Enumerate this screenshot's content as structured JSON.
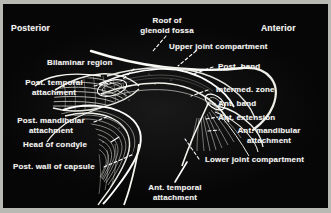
{
  "figure": {
    "kind": "anatomical-illustration",
    "plate_background": "#060606",
    "label_color": "#f2f2ef",
    "border_color": "#b9b9b4"
  },
  "orientation": {
    "posterior": "Posterior",
    "anterior": "Anterior"
  },
  "labels": {
    "roof_of_glenoid_fossa": "Roof of\nglenoid fossa",
    "upper_joint_compartment": "Upper joint compartment",
    "bilaminar_region": "Bilaminar region",
    "post_temporal_attachment": "Post. temporal\nattachment",
    "post_mandibular_attachment": "Post. mandibular\nattachment",
    "head_of_condyle": "Head of condyle",
    "post_wall_of_capsule": "Post. wall of capsule",
    "ant_temporal_attachment": "Ant. temporal\nattachment",
    "post_band": "Post. band",
    "intermed_zone": "Intermed. zone",
    "ant_band": "Ant. band",
    "ant_extension": "Ant. extension",
    "ant_mandibular_attachment": "Ant. mandibular\nattachment",
    "lower_joint_compartment": "Lower joint compartment"
  }
}
